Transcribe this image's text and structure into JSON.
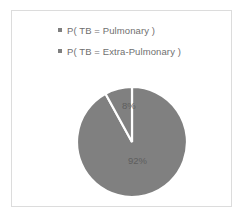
{
  "chart_data": {
    "type": "pie",
    "title": "",
    "categories": [
      "P( TB = Pulmonary )",
      "P( TB = Extra-Pulmonary )"
    ],
    "values": [
      92,
      8
    ],
    "data_labels": [
      "92%",
      "8%"
    ],
    "legend_position": "top",
    "grid": false,
    "colors": {
      "slice_fill": "#808080",
      "slice_separator": "#ffffff",
      "legend_marker": "#7f7f7f",
      "legend_text": "#6f6f6f",
      "label_text": "#5e5e5e",
      "frame_border": "#dcdcdc",
      "background": "#ffffff"
    },
    "start_angle_deg": 0,
    "direction": "clockwise"
  },
  "legend": {
    "items": [
      {
        "label": "P( TB = Pulmonary )",
        "marker": "square-marker-icon"
      },
      {
        "label": "P( TB = Extra-Pulmonary )",
        "marker": "square-marker-icon"
      }
    ]
  },
  "pie": {
    "major_slice_label": "92%",
    "minor_slice_label": "8%"
  }
}
